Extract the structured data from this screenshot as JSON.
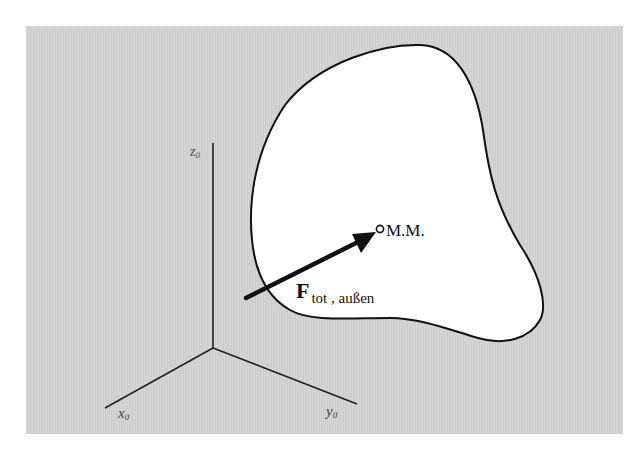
{
  "figure": {
    "background_color": "#ffffff",
    "panel_color": "#d3d3d3",
    "body_fill": "#ffffff",
    "stroke_color": "#111111",
    "axes": {
      "origin": [
        213,
        348
      ],
      "z": {
        "label": "z",
        "subscript": "0",
        "end": [
          213,
          143
        ]
      },
      "x": {
        "label": "x",
        "subscript": "0",
        "end": [
          105,
          408
        ]
      },
      "y": {
        "label": "y",
        "subscript": "0",
        "end": [
          357,
          404
        ]
      }
    },
    "center_of_mass": {
      "label": "M.M.",
      "point": [
        380,
        229
      ]
    },
    "force": {
      "symbol": "F",
      "subscript": "tot , außen",
      "tail": [
        246,
        298
      ],
      "head": [
        375,
        233
      ]
    }
  }
}
